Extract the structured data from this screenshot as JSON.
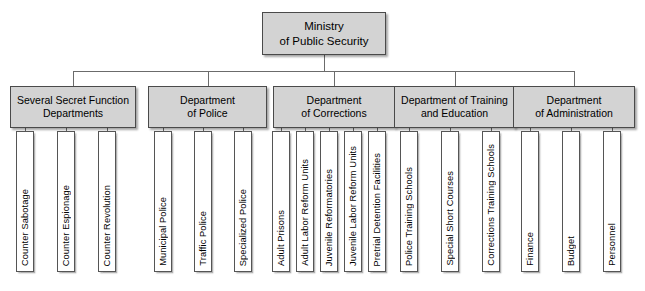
{
  "chart_data": {
    "type": "diagram",
    "root": "Ministry\nof Public Security",
    "levels": 3,
    "departments": [
      {
        "label": "Several Secret Function\nDepartments",
        "children": [
          "Counter Sabotage",
          "Counter Espionage",
          "Counter Revolution"
        ]
      },
      {
        "label": "Department\nof Police",
        "children": [
          "Municipal Police",
          "Traffic Police",
          "Specialized Police"
        ]
      },
      {
        "label": "Department\nof Corrections",
        "children": [
          "Adult Prisons",
          "Adult Labor Reform Units",
          "Juvenile Reformatories",
          "Juvenile Labor Reform Units",
          "Pretrial Detention Facilities"
        ]
      },
      {
        "label": "Department of Training\nand Education",
        "children": [
          "Police Training Schools",
          "Special Short Courses",
          "Corrections Training Schools"
        ]
      },
      {
        "label": "Department\nof Administration",
        "children": [
          "Finance",
          "Budget",
          "Personnel"
        ]
      }
    ]
  },
  "root": {
    "label": "Ministry\nof Public Security"
  },
  "departments": [
    {
      "id": "secret-function",
      "label": "Several Secret Function\nDepartments",
      "x": 10,
      "y": 86,
      "w": 126,
      "h": 42,
      "children": [
        {
          "label": "Counter Sabotage",
          "x": 16,
          "y": 131,
          "w": 18,
          "h": 141
        },
        {
          "label": "Counter Espionage",
          "x": 57,
          "y": 131,
          "w": 18,
          "h": 141
        },
        {
          "label": "Counter Revolution",
          "x": 98,
          "y": 131,
          "w": 18,
          "h": 141
        }
      ]
    },
    {
      "id": "police",
      "label": "Department\nof Police",
      "x": 148,
      "y": 86,
      "w": 119,
      "h": 42,
      "children": [
        {
          "label": "Municipal Police",
          "x": 154,
          "y": 131,
          "w": 18,
          "h": 141
        },
        {
          "label": "Traffic Police",
          "x": 194,
          "y": 131,
          "w": 18,
          "h": 141
        },
        {
          "label": "Specialized Police",
          "x": 234,
          "y": 131,
          "w": 18,
          "h": 141
        }
      ]
    },
    {
      "id": "corrections",
      "label": "Department\nof Corrections",
      "x": 273,
      "y": 86,
      "w": 122,
      "h": 42,
      "children": [
        {
          "label": "Adult Prisons",
          "x": 272,
          "y": 131,
          "w": 18,
          "h": 141
        },
        {
          "label": "Adult Labor Reform Units",
          "x": 296,
          "y": 131,
          "w": 18,
          "h": 141
        },
        {
          "label": "Juvenile Reformatories",
          "x": 320,
          "y": 131,
          "w": 18,
          "h": 141
        },
        {
          "label": "Juvenile Labor Reform Units",
          "x": 344,
          "y": 131,
          "w": 18,
          "h": 141
        },
        {
          "label": "Pretrial Detention Facilities",
          "x": 368,
          "y": 131,
          "w": 18,
          "h": 141
        }
      ]
    },
    {
      "id": "training-education",
      "label": "Department of Training\nand Education",
      "x": 394,
      "y": 86,
      "w": 121,
      "h": 42,
      "children": [
        {
          "label": "Police Training Schools",
          "x": 400,
          "y": 131,
          "w": 18,
          "h": 141
        },
        {
          "label": "Special Short Courses",
          "x": 441,
          "y": 131,
          "w": 18,
          "h": 141
        },
        {
          "label": "Corrections Training Schools",
          "x": 482,
          "y": 131,
          "w": 18,
          "h": 141
        }
      ]
    },
    {
      "id": "administration",
      "label": "Department\nof Administration",
      "x": 513,
      "y": 86,
      "w": 122,
      "h": 42,
      "children": [
        {
          "label": "Finance",
          "x": 521,
          "y": 131,
          "w": 18,
          "h": 141
        },
        {
          "label": "Budget",
          "x": 562,
          "y": 131,
          "w": 18,
          "h": 141
        },
        {
          "label": "Personnel",
          "x": 603,
          "y": 131,
          "w": 18,
          "h": 141
        }
      ]
    }
  ]
}
